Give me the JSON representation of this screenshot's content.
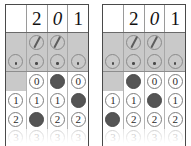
{
  "document": {
    "kind": "answer-grid-sheet",
    "grid_count": 2
  },
  "symbols": {
    "fraction_bar": "/",
    "decimal_point": ".",
    "blank": ""
  },
  "grids": [
    {
      "name": "grid-left",
      "written_answer": [
        "",
        "2",
        "0",
        "1"
      ],
      "written_italic": [
        false,
        false,
        true,
        false
      ],
      "fraction_row": [
        false,
        true,
        true,
        false
      ],
      "decimal_row": [
        true,
        true,
        true,
        true
      ],
      "fraction_marked": [
        false,
        false,
        false,
        false
      ],
      "decimal_marked": [
        false,
        false,
        false,
        false
      ],
      "digit_rows": [
        {
          "label": "0",
          "cells": [
            {
              "present": false,
              "label": "0",
              "filled": false
            },
            {
              "present": true,
              "label": "0",
              "filled": false
            },
            {
              "present": true,
              "label": "0",
              "filled": true
            },
            {
              "present": true,
              "label": "0",
              "filled": false
            }
          ]
        },
        {
          "label": "1",
          "cells": [
            {
              "present": true,
              "label": "1",
              "filled": false
            },
            {
              "present": true,
              "label": "1",
              "filled": false
            },
            {
              "present": true,
              "label": "1",
              "filled": false
            },
            {
              "present": true,
              "label": "1",
              "filled": true
            }
          ]
        },
        {
          "label": "2",
          "cells": [
            {
              "present": true,
              "label": "2",
              "filled": false
            },
            {
              "present": true,
              "label": "2",
              "filled": true
            },
            {
              "present": true,
              "label": "2",
              "filled": false
            },
            {
              "present": true,
              "label": "2",
              "filled": false
            }
          ]
        },
        {
          "label": "3",
          "cells": [
            {
              "present": true,
              "label": "3",
              "filled": false
            },
            {
              "present": true,
              "label": "3",
              "filled": false
            },
            {
              "present": true,
              "label": "3",
              "filled": false
            },
            {
              "present": true,
              "label": "3",
              "filled": false
            }
          ]
        }
      ]
    },
    {
      "name": "grid-right",
      "written_answer": [
        "",
        "2",
        "0",
        "1"
      ],
      "written_italic": [
        false,
        false,
        true,
        false
      ],
      "fraction_row": [
        false,
        true,
        true,
        false
      ],
      "decimal_row": [
        true,
        true,
        true,
        true
      ],
      "fraction_marked": [
        false,
        false,
        false,
        false
      ],
      "decimal_marked": [
        false,
        false,
        false,
        false
      ],
      "digit_rows": [
        {
          "label": "0",
          "cells": [
            {
              "present": false,
              "label": "0",
              "filled": false
            },
            {
              "present": true,
              "label": "0",
              "filled": true
            },
            {
              "present": true,
              "label": "0",
              "filled": false
            },
            {
              "present": true,
              "label": "0",
              "filled": false
            }
          ]
        },
        {
          "label": "1",
          "cells": [
            {
              "present": true,
              "label": "1",
              "filled": false
            },
            {
              "present": true,
              "label": "1",
              "filled": false
            },
            {
              "present": true,
              "label": "1",
              "filled": true
            },
            {
              "present": true,
              "label": "1",
              "filled": false
            }
          ]
        },
        {
          "label": "2",
          "cells": [
            {
              "present": true,
              "label": "2",
              "filled": true
            },
            {
              "present": true,
              "label": "2",
              "filled": false
            },
            {
              "present": true,
              "label": "2",
              "filled": false
            },
            {
              "present": true,
              "label": "2",
              "filled": false
            }
          ]
        },
        {
          "label": "3",
          "cells": [
            {
              "present": true,
              "label": "3",
              "filled": false
            },
            {
              "present": true,
              "label": "3",
              "filled": false
            },
            {
              "present": true,
              "label": "3",
              "filled": false
            },
            {
              "present": true,
              "label": "3",
              "filled": false
            }
          ]
        }
      ]
    }
  ],
  "colors": {
    "band_shade": "#c9c9c9",
    "bubble_fill": "#555555",
    "bubble_outline": "#8a8a8a",
    "grid_border": "#4a4a4a",
    "ink": "#111111",
    "paper": "#ffffff"
  }
}
